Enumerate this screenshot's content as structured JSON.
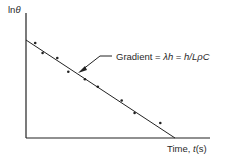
{
  "chart_data": {
    "type": "scatter",
    "title": "",
    "xlabel": "Time, t(s)",
    "ylabel": "ln θ",
    "annotation": "Gradient = λh = h/LρC",
    "grid": false,
    "legend": null,
    "fit_line": {
      "x_start": 0,
      "y_start": 0.78,
      "x_end": 0.81,
      "y_end": 0.0,
      "description": "straight line, negative slope"
    },
    "points": [
      {
        "x": 0.05,
        "y": 0.76
      },
      {
        "x": 0.09,
        "y": 0.68
      },
      {
        "x": 0.17,
        "y": 0.64
      },
      {
        "x": 0.23,
        "y": 0.53
      },
      {
        "x": 0.32,
        "y": 0.47
      },
      {
        "x": 0.39,
        "y": 0.41
      },
      {
        "x": 0.52,
        "y": 0.3
      },
      {
        "x": 0.59,
        "y": 0.2
      },
      {
        "x": 0.73,
        "y": 0.12
      }
    ],
    "xlim": [
      0,
      1
    ],
    "ylim": [
      0,
      1
    ]
  },
  "labels": {
    "y_axis_prefix": "ln",
    "y_axis_symbol": "θ",
    "x_axis_text": "Time, ",
    "x_axis_var": "t",
    "x_axis_unit": "(s)",
    "gradient_prefix": "Gradient = ",
    "gradient_lambda_h": "λh",
    "gradient_eq": " = ",
    "gradient_rhs": "h/LρC"
  }
}
